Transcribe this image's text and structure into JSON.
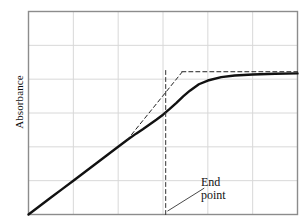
{
  "figure": {
    "name": "titration-curve-figure",
    "background": "#ffffff",
    "width": 304,
    "height": 224
  },
  "chart_data": {
    "type": "line",
    "title": "",
    "xlabel": "",
    "ylabel": "Absorbance",
    "xlim": [
      0,
      6
    ],
    "ylim": [
      0,
      6
    ],
    "grid": true,
    "grid_color": "#d8d8d8",
    "grid_x_ticks": [
      1,
      2,
      3,
      4,
      5
    ],
    "grid_y_ticks": [
      1,
      2,
      3,
      4,
      5
    ],
    "tick_labels_x": [],
    "tick_labels_y": [],
    "legend": "none",
    "axes_frame_color": "#8c8c8c",
    "series": [
      {
        "name": "titration-curve",
        "style": "solid",
        "color": "#111111",
        "width": 2.4,
        "x": [
          0.0,
          0.25,
          0.5,
          0.75,
          1.0,
          1.25,
          1.5,
          1.75,
          2.0,
          2.2,
          2.4,
          2.55,
          2.7,
          2.85,
          3.0,
          3.15,
          3.3,
          3.45,
          3.6,
          3.8,
          4.0,
          4.3,
          4.6,
          5.0,
          5.5,
          6.0
        ],
        "y": [
          0.0,
          0.25,
          0.5,
          0.75,
          1.0,
          1.25,
          1.5,
          1.75,
          2.0,
          2.2,
          2.39,
          2.52,
          2.66,
          2.8,
          2.95,
          3.12,
          3.3,
          3.49,
          3.66,
          3.85,
          3.96,
          4.06,
          4.11,
          4.14,
          4.16,
          4.17
        ]
      },
      {
        "name": "linear-extrapolation-dashed",
        "style": "dashed",
        "color": "#222222",
        "width": 1.0,
        "x": [
          2.2,
          3.42
        ],
        "y": [
          2.2,
          4.2
        ]
      },
      {
        "name": "plateau-extrapolation-dashed",
        "style": "dashed",
        "color": "#222222",
        "width": 1.0,
        "x": [
          3.42,
          6.0
        ],
        "y": [
          4.22,
          4.22
        ]
      },
      {
        "name": "endpoint-vertical-dashed",
        "style": "dashed",
        "color": "#333333",
        "width": 1.0,
        "x": [
          3.06,
          3.06
        ],
        "y": [
          0.0,
          4.26
        ]
      }
    ],
    "annotations": [
      {
        "name": "end-point-annotation",
        "text_lines": [
          "End",
          "point"
        ],
        "text": "End point",
        "x": 4.1,
        "y": 0.62,
        "leader_from": [
          3.1,
          0.1
        ],
        "leader_to": [
          3.92,
          0.78
        ],
        "leader_color": "#333333"
      }
    ]
  },
  "labels": {
    "y_axis": "Absorbance",
    "end_point_line1": "End",
    "end_point_line2": "point"
  }
}
